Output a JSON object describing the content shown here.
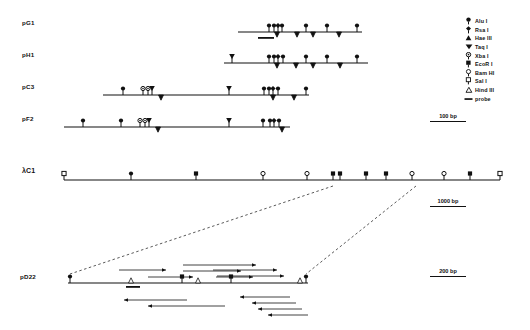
{
  "figure": {
    "background": "#ffffff",
    "ink": "#111111"
  },
  "legend": {
    "name": "enzyme-legend",
    "items": [
      {
        "symbol": "alu-i-icon",
        "glyph": "filled-circle-pin",
        "label": "Alu I"
      },
      {
        "symbol": "rsa-i-icon",
        "glyph": "filled-diamond-pin",
        "label": "Rsa I"
      },
      {
        "symbol": "hae-iii-icon",
        "glyph": "filled-triangle-up",
        "label": "Hae III"
      },
      {
        "symbol": "taq-i-icon",
        "glyph": "filled-triangle-down",
        "label": "Taq I"
      },
      {
        "symbol": "xba-i-icon",
        "glyph": "dotted-circle-pin",
        "label": "Xba I"
      },
      {
        "symbol": "ecor-i-icon",
        "glyph": "filled-square-pin",
        "label": "EcoR I"
      },
      {
        "symbol": "bam-hi-icon",
        "glyph": "open-circle-pin",
        "label": "Bam HI"
      },
      {
        "symbol": "sal-i-icon",
        "glyph": "open-square-pin",
        "label": "Sal I"
      },
      {
        "symbol": "hind-iii-icon",
        "glyph": "open-triangle-up",
        "label": "Hind III"
      },
      {
        "symbol": "probe-icon",
        "glyph": "bar",
        "label": "probe"
      }
    ]
  },
  "scalebars": [
    {
      "name": "scalebar-100bp",
      "label": "100 bp",
      "x": 430,
      "y": 113,
      "width": 36
    },
    {
      "name": "scalebar-1000bp",
      "label": "1000 bp",
      "x": 430,
      "y": 198,
      "width": 36
    },
    {
      "name": "scalebar-200bp",
      "label": "200 bp",
      "x": 430,
      "y": 268,
      "width": 36
    }
  ],
  "rows": [
    {
      "name": "row-pg1",
      "label": "pG1",
      "label_x": 22,
      "label_y": 22,
      "axis": {
        "y": 32,
        "x1": 238,
        "x2": 362
      },
      "probe": {
        "x1": 258,
        "x2": 274,
        "y": 37
      },
      "markers": [
        {
          "type": "alu",
          "x": 269,
          "side": "top"
        },
        {
          "type": "alu",
          "x": 274,
          "side": "top"
        },
        {
          "type": "rsa",
          "x": 278,
          "side": "top"
        },
        {
          "type": "alu",
          "x": 282,
          "side": "top"
        },
        {
          "type": "alu",
          "x": 306,
          "side": "top"
        },
        {
          "type": "alu",
          "x": 327,
          "side": "top"
        },
        {
          "type": "alu",
          "x": 357,
          "side": "top"
        },
        {
          "type": "hae",
          "x": 277,
          "side": "bottom"
        },
        {
          "type": "hae",
          "x": 297,
          "side": "bottom"
        },
        {
          "type": "hae",
          "x": 313,
          "side": "bottom"
        },
        {
          "type": "hae",
          "x": 339,
          "side": "bottom"
        }
      ]
    },
    {
      "name": "row-ph1",
      "label": "pH1",
      "label_x": 22,
      "label_y": 54,
      "axis": {
        "y": 63,
        "x1": 224,
        "x2": 368
      },
      "probe": null,
      "markers": [
        {
          "type": "taq",
          "x": 232,
          "side": "top"
        },
        {
          "type": "alu",
          "x": 269,
          "side": "top"
        },
        {
          "type": "alu",
          "x": 274,
          "side": "top"
        },
        {
          "type": "rsa",
          "x": 278,
          "side": "top"
        },
        {
          "type": "alu",
          "x": 283,
          "side": "top"
        },
        {
          "type": "alu",
          "x": 306,
          "side": "top"
        },
        {
          "type": "alu",
          "x": 327,
          "side": "top"
        },
        {
          "type": "alu",
          "x": 357,
          "side": "top"
        },
        {
          "type": "hae",
          "x": 277,
          "side": "bottom"
        },
        {
          "type": "hae",
          "x": 296,
          "side": "bottom"
        },
        {
          "type": "hae",
          "x": 313,
          "side": "bottom"
        },
        {
          "type": "hae",
          "x": 340,
          "side": "bottom"
        }
      ]
    },
    {
      "name": "row-pc3",
      "label": "pC3",
      "label_x": 22,
      "label_y": 86,
      "axis": {
        "y": 95,
        "x1": 103,
        "x2": 309
      },
      "probe": null,
      "markers": [
        {
          "type": "alu",
          "x": 123,
          "side": "top"
        },
        {
          "type": "xba",
          "x": 143,
          "side": "top"
        },
        {
          "type": "xba",
          "x": 148,
          "side": "top"
        },
        {
          "type": "taq",
          "x": 152,
          "side": "top"
        },
        {
          "type": "taq",
          "x": 229,
          "side": "top"
        },
        {
          "type": "alu",
          "x": 264,
          "side": "top"
        },
        {
          "type": "alu",
          "x": 269,
          "side": "top"
        },
        {
          "type": "rsa",
          "x": 273,
          "side": "top"
        },
        {
          "type": "alu",
          "x": 278,
          "side": "top"
        },
        {
          "type": "alu",
          "x": 306,
          "side": "top"
        },
        {
          "type": "hae",
          "x": 161,
          "side": "bottom"
        },
        {
          "type": "hae",
          "x": 273,
          "side": "bottom"
        },
        {
          "type": "hae",
          "x": 294,
          "side": "bottom"
        }
      ]
    },
    {
      "name": "row-pf2",
      "label": "pF2",
      "label_x": 22,
      "label_y": 118,
      "axis": {
        "y": 127,
        "x1": 64,
        "x2": 290
      },
      "probe": null,
      "markers": [
        {
          "type": "alu",
          "x": 83,
          "side": "top"
        },
        {
          "type": "alu",
          "x": 121,
          "side": "top"
        },
        {
          "type": "xba",
          "x": 140,
          "side": "top"
        },
        {
          "type": "xba",
          "x": 145,
          "side": "top"
        },
        {
          "type": "taq",
          "x": 149,
          "side": "top"
        },
        {
          "type": "taq",
          "x": 229,
          "side": "top"
        },
        {
          "type": "alu",
          "x": 263,
          "side": "top"
        },
        {
          "type": "alu",
          "x": 270,
          "side": "top"
        },
        {
          "type": "rsa",
          "x": 274,
          "side": "top"
        },
        {
          "type": "alu",
          "x": 279,
          "side": "top"
        },
        {
          "type": "hae",
          "x": 158,
          "side": "bottom"
        },
        {
          "type": "hae",
          "x": 282,
          "side": "bottom"
        }
      ]
    }
  ],
  "lambda": {
    "name": "row-lambda-c1",
    "label": "λC1",
    "label_x": 22,
    "label_y": 170,
    "axis": {
      "y": 180,
      "x1": 64,
      "x2": 500
    },
    "markers": [
      {
        "type": "sal",
        "x": 64,
        "side": "top"
      },
      {
        "type": "alu",
        "x": 131,
        "side": "top"
      },
      {
        "type": "ecor",
        "x": 196,
        "side": "top"
      },
      {
        "type": "bam",
        "x": 263,
        "side": "top"
      },
      {
        "type": "bam",
        "x": 307,
        "side": "top"
      },
      {
        "type": "ecor",
        "x": 333,
        "side": "top"
      },
      {
        "type": "ecor",
        "x": 340,
        "side": "top"
      },
      {
        "type": "ecor",
        "x": 366,
        "side": "top"
      },
      {
        "type": "ecor",
        "x": 386,
        "side": "top"
      },
      {
        "type": "bam",
        "x": 412,
        "side": "top"
      },
      {
        "type": "bam",
        "x": 444,
        "side": "top"
      },
      {
        "type": "ecor",
        "x": 470,
        "side": "top"
      },
      {
        "type": "sal",
        "x": 500,
        "side": "top"
      }
    ]
  },
  "expansion": {
    "name": "expansion-connectors",
    "from_left_x": 333,
    "from_right_x": 416,
    "from_y": 186,
    "to_left_x": 70,
    "to_right_x": 306,
    "to_y": 274
  },
  "pd22": {
    "name": "row-pd22",
    "label": "pD22",
    "label_x": 22,
    "label_y": 276,
    "axis": {
      "y": 283,
      "x1": 68,
      "x2": 308
    },
    "probe": {
      "x1": 126,
      "x2": 140,
      "y": 286
    },
    "markers": [
      {
        "type": "alu",
        "x": 70,
        "side": "top"
      },
      {
        "type": "hind",
        "x": 131,
        "side": "top"
      },
      {
        "type": "ecor",
        "x": 182,
        "side": "top"
      },
      {
        "type": "hind",
        "x": 198,
        "side": "top"
      },
      {
        "type": "ecor",
        "x": 231,
        "side": "top"
      },
      {
        "type": "hind",
        "x": 300,
        "side": "top"
      },
      {
        "type": "alu",
        "x": 306,
        "side": "top"
      }
    ],
    "sequencing_arrows": [
      {
        "x1": 119,
        "x2": 166,
        "y": 270,
        "dir": "right"
      },
      {
        "x1": 148,
        "x2": 193,
        "y": 277,
        "dir": "right"
      },
      {
        "x1": 183,
        "x2": 256,
        "y": 265,
        "dir": "right"
      },
      {
        "x1": 183,
        "x2": 241,
        "y": 271,
        "dir": "right"
      },
      {
        "x1": 216,
        "x2": 253,
        "y": 277,
        "dir": "right"
      },
      {
        "x1": 213,
        "x2": 277,
        "y": 270,
        "dir": "right"
      },
      {
        "x1": 217,
        "x2": 284,
        "y": 276,
        "dir": "right"
      },
      {
        "x1": 124,
        "x2": 187,
        "y": 300,
        "dir": "left"
      },
      {
        "x1": 148,
        "x2": 225,
        "y": 306,
        "dir": "left"
      },
      {
        "x1": 240,
        "x2": 290,
        "y": 297,
        "dir": "left"
      },
      {
        "x1": 252,
        "x2": 296,
        "y": 303,
        "dir": "left"
      },
      {
        "x1": 258,
        "x2": 302,
        "y": 309,
        "dir": "left"
      },
      {
        "x1": 268,
        "x2": 308,
        "y": 315,
        "dir": "left"
      }
    ]
  }
}
